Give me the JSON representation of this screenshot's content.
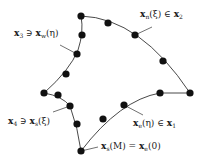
{
  "diagram": {
    "type": "curvilinear-quadrilateral-boundary",
    "colors": {
      "curve": "#333333",
      "node": "#111111",
      "leader": "#333333",
      "text": "#1a1a1a",
      "background": "#ffffff"
    },
    "nodes": [
      {
        "id": "corner-top",
        "x": 81,
        "y": 16
      },
      {
        "id": "north-1",
        "x": 108,
        "y": 23
      },
      {
        "id": "north-2",
        "x": 135,
        "y": 35
      },
      {
        "id": "north-3",
        "x": 163,
        "y": 61
      },
      {
        "id": "corner-right",
        "x": 190,
        "y": 93
      },
      {
        "id": "east-1",
        "x": 160,
        "y": 93
      },
      {
        "id": "east-2",
        "x": 124,
        "y": 105
      },
      {
        "id": "east-3",
        "x": 103,
        "y": 119
      },
      {
        "id": "corner-bottom",
        "x": 81,
        "y": 151
      },
      {
        "id": "south-1",
        "x": 77,
        "y": 124
      },
      {
        "id": "south-2",
        "x": 70,
        "y": 106
      },
      {
        "id": "south-3",
        "x": 58,
        "y": 95
      },
      {
        "id": "corner-left",
        "x": 44,
        "y": 93
      },
      {
        "id": "west-1",
        "x": 66,
        "y": 74
      },
      {
        "id": "west-2",
        "x": 77,
        "y": 54
      },
      {
        "id": "west-3",
        "x": 82,
        "y": 35
      }
    ],
    "labels": {
      "north": {
        "text": "x_n(ξ) ∈ x_2",
        "main": "x",
        "main_sub": "n",
        "arg": "(ξ)",
        "rel": " ∈ ",
        "rhs": "x",
        "rhs_sub": "2",
        "x": 140,
        "y": 10,
        "leader": {
          "x1": 135,
          "y1": 35,
          "x2": 152,
          "y2": 27
        }
      },
      "west": {
        "text": "x_3 ∋ x_w(η)",
        "main": "x",
        "main_sub": "3",
        "rel": " ∋ ",
        "rhs": "x",
        "rhs_sub": "w",
        "arg": "(η)",
        "x": 14,
        "y": 29,
        "leader": {
          "x1": 60,
          "y1": 45,
          "x2": 77,
          "y2": 54
        }
      },
      "south": {
        "text": "x_4 ∋ x_s(ξ)",
        "main": "x",
        "main_sub": "4",
        "rel": " ∋ ",
        "rhs": "x",
        "rhs_sub": "s",
        "arg": "(ξ)",
        "x": 8,
        "y": 117,
        "leader": {
          "x1": 53,
          "y1": 112,
          "x2": 70,
          "y2": 106
        }
      },
      "east": {
        "text": "x_e(η) ∈ x_1",
        "main": "x",
        "main_sub": "e",
        "arg": "(η)",
        "rel": " ∈ ",
        "rhs": "x",
        "rhs_sub": "1",
        "x": 133,
        "y": 119,
        "leader": {
          "x1": 124,
          "y1": 105,
          "x2": 143,
          "y2": 115
        }
      },
      "corner": {
        "text": "x_s(M) = x_e(0)",
        "main": "x",
        "main_sub": "s",
        "arg": "(M)",
        "rel": " = ",
        "rhs": "x",
        "rhs_sub": "e",
        "rhs_arg": "(0)",
        "x": 101,
        "y": 142,
        "leader": {
          "x1": 81,
          "y1": 151,
          "x2": 98,
          "y2": 147
        }
      }
    }
  }
}
